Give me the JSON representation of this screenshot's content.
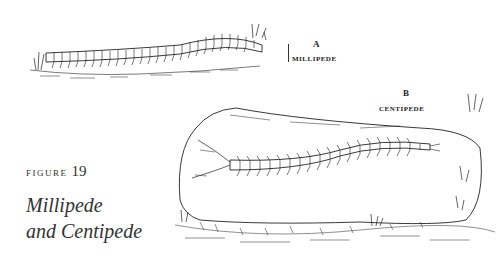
{
  "figure": {
    "label_prefix": "FIGURE",
    "number": "19",
    "caption_line1": "Millipede",
    "caption_line2": "and Centipede"
  },
  "illustrations": [
    {
      "letter": "A",
      "name": "MILLIPEDE"
    },
    {
      "letter": "B",
      "name": "CENTIPEDE"
    }
  ],
  "colors": {
    "background": "#ffffff",
    "ink": "#222222"
  }
}
